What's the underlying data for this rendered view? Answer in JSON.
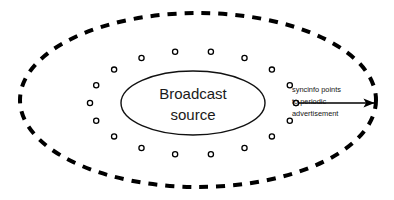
{
  "figure": {
    "type": "network-coverage-diagram",
    "background_color": "#ffffff",
    "stroke_color": "#000000",
    "text_color": "#1a1a1a"
  },
  "outer_boundary": {
    "shape": "ellipse",
    "style": "dashed",
    "label": "",
    "cx": 198,
    "cy": 100,
    "rx": 178,
    "ry": 87,
    "dash_length": 9,
    "dash_gap": 8,
    "stroke_width": 4
  },
  "broadcast_source": {
    "shape": "ellipse",
    "style": "solid",
    "line1": "Broadcast",
    "line2": "source",
    "cx": 193,
    "cy": 103,
    "rx": 72,
    "ry": 32,
    "stroke_width": 1.4
  },
  "node_ring": {
    "description": "ring of syncinfo receiver nodes around broadcast source",
    "count": 18,
    "marker": "hollow-circle",
    "radius_px": 2.6,
    "cx": 193,
    "cy": 103,
    "rx": 103,
    "ry": 52,
    "start_angle_deg": 0
  },
  "annotation": {
    "arrow_label_line1": "syncinfo points",
    "arrow_label_line2": "to periodic",
    "arrow_label_line3": "advertisement",
    "arrow_from_x": 296,
    "arrow_from_y": 103,
    "arrow_to_x": 379,
    "arrow_to_y": 103,
    "source_marker": "hollow-circle",
    "text_x": 292,
    "text_y": 90
  }
}
